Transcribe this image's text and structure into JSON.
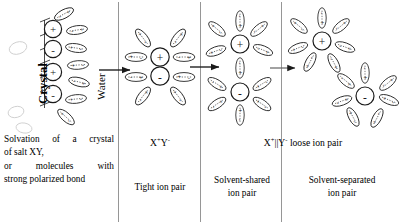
{
  "figure": {
    "ink_color": "#1a1a1a",
    "background": "#ffffff"
  },
  "vertical_labels": {
    "crystal": "Crystal",
    "water": "Water"
  },
  "panels": [
    {
      "id": "crystal",
      "formula": "",
      "caption_lines": [
        "Solvation of a crystal",
        "of salt XY,",
        "or molecules with",
        "strong polarized bond"
      ],
      "subcaption": ""
    },
    {
      "id": "tight-ion-pair",
      "formula_parts": {
        "cation": "X",
        "cation_charge": "+",
        "anion": "Y",
        "anion_charge": "-",
        "separator": ""
      },
      "formula_text": "X+Y-",
      "subcaption": "Tight ion pair"
    },
    {
      "id": "solvent-shared-ion-pair",
      "formula_parts": {
        "cation": "X",
        "cation_charge": "+",
        "anion": "Y",
        "anion_charge": "-",
        "separator": "||"
      },
      "formula_text": "X+||Y- loose ion pair",
      "subcaption_lines": [
        "Solvent-shared",
        "ion pair"
      ]
    },
    {
      "id": "solvent-separated-ion-pair",
      "formula": "",
      "subcaption_lines": [
        "Solvent-separated",
        "ion pair"
      ]
    }
  ],
  "loose_pair_label": {
    "cation": "X",
    "cation_charge": "+",
    "separator": "||",
    "anion": "Y",
    "anion_charge": "-",
    "trailing": " loose ion pair"
  },
  "ions": {
    "cation_symbol": "+",
    "anion_symbol": "-"
  },
  "dipole": {
    "positive_end": "+",
    "negative_end": "-"
  },
  "arrows": [
    {
      "id": "arrow-crystal-to-tight",
      "label": "Water"
    },
    {
      "id": "arrow-tight-to-shared",
      "label": ""
    },
    {
      "id": "arrow-shared-to-separated",
      "label": ""
    }
  ],
  "dividers": [
    118,
    200,
    281
  ]
}
